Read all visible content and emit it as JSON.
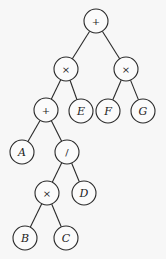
{
  "diagram": {
    "type": "binary-expression-tree",
    "expression": "((A + (B × C) / D) × E) + (F × G)",
    "node_radius": 12,
    "colors": {
      "background": "#f7f7f7",
      "stroke": "#2a2a2a",
      "node_fill": "#fbfbfb",
      "text": "#1c1c1c"
    },
    "nodes": [
      {
        "id": "n1",
        "label": "+",
        "kind": "operator",
        "x": 96,
        "y": 21
      },
      {
        "id": "n2",
        "label": "×",
        "kind": "operator",
        "x": 66,
        "y": 69
      },
      {
        "id": "n3",
        "label": "×",
        "kind": "operator",
        "x": 126,
        "y": 69
      },
      {
        "id": "n4",
        "label": "+",
        "kind": "operator",
        "x": 46,
        "y": 110
      },
      {
        "id": "n5",
        "label": "E",
        "kind": "operand",
        "x": 81,
        "y": 111
      },
      {
        "id": "n6",
        "label": "F",
        "kind": "operand",
        "x": 108,
        "y": 111
      },
      {
        "id": "n7",
        "label": "G",
        "kind": "operand",
        "x": 143,
        "y": 111
      },
      {
        "id": "n8",
        "label": "A",
        "kind": "operand",
        "x": 22,
        "y": 152
      },
      {
        "id": "n9",
        "label": "/",
        "kind": "operator",
        "x": 67,
        "y": 152
      },
      {
        "id": "n10",
        "label": "×",
        "kind": "operator",
        "x": 47,
        "y": 193
      },
      {
        "id": "n11",
        "label": "D",
        "kind": "operand",
        "x": 84,
        "y": 193
      },
      {
        "id": "n12",
        "label": "B",
        "kind": "operand",
        "x": 25,
        "y": 238
      },
      {
        "id": "n13",
        "label": "C",
        "kind": "operand",
        "x": 66,
        "y": 238
      }
    ],
    "edges": [
      {
        "from": "n1",
        "to": "n2"
      },
      {
        "from": "n1",
        "to": "n3"
      },
      {
        "from": "n2",
        "to": "n4"
      },
      {
        "from": "n2",
        "to": "n5"
      },
      {
        "from": "n3",
        "to": "n6"
      },
      {
        "from": "n3",
        "to": "n7"
      },
      {
        "from": "n4",
        "to": "n8"
      },
      {
        "from": "n4",
        "to": "n9"
      },
      {
        "from": "n9",
        "to": "n10"
      },
      {
        "from": "n9",
        "to": "n11"
      },
      {
        "from": "n10",
        "to": "n12"
      },
      {
        "from": "n10",
        "to": "n13"
      }
    ]
  }
}
